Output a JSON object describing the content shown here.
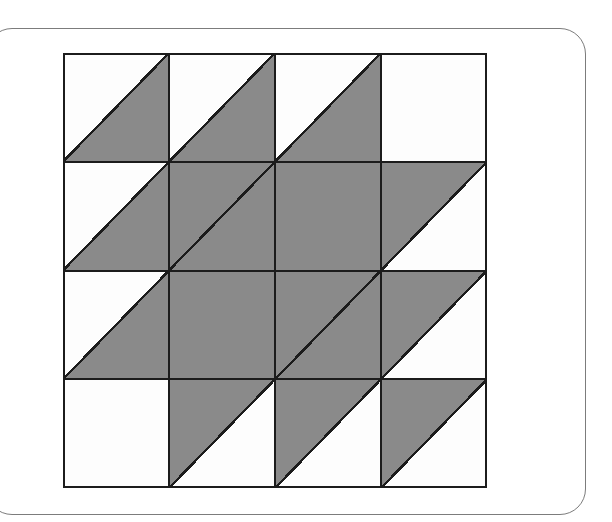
{
  "page": {
    "background_color": "#ffffff",
    "frame": {
      "name": "rounded-page-frame",
      "border_color": "#7c7c7c",
      "border_radius_px": 26
    }
  },
  "figure": {
    "name": "quilt-block-pattern",
    "grid_rows": 4,
    "grid_cols": 4,
    "x_px": 63,
    "y_px": 53,
    "width_px": 424,
    "height_px": 435,
    "cell_width_px": 106,
    "cell_height_px": 108.75,
    "fill_color": "#8a8a8a",
    "empty_color": "#fdfdfd",
    "line_color": "#1c1c1c",
    "outer_line_width_px": 2,
    "inner_line_width_px": 2,
    "diagonal_line_width_px": 2.4,
    "diagonal_direction": "bottom-left-to-top-right"
  },
  "chart_data": {
    "type": "heatmap",
    "title": "",
    "xlabel": "",
    "ylabel": "",
    "categories_x": [
      "1",
      "2",
      "3",
      "4"
    ],
    "categories_y": [
      "1",
      "2",
      "3",
      "4"
    ],
    "legend": [
      {
        "label": "shaded half",
        "color": "#8a8a8a"
      },
      {
        "label": "unshaded half",
        "color": "#fdfdfd"
      }
    ],
    "cell_states": [
      [
        "lower-right",
        "lower-right",
        "lower-right",
        "empty"
      ],
      [
        "lower-right",
        "full-diagonal",
        "full",
        "upper-left"
      ],
      [
        "lower-right",
        "full",
        "full-diagonal",
        "upper-left"
      ],
      [
        "empty",
        "upper-left",
        "upper-left",
        "upper-left"
      ]
    ],
    "shaded_fraction_values": [
      [
        0.5,
        0.5,
        0.5,
        0.0
      ],
      [
        0.5,
        1.0,
        1.0,
        0.5
      ],
      [
        0.5,
        1.0,
        1.0,
        0.5
      ],
      [
        0.0,
        0.5,
        0.5,
        0.5
      ]
    ],
    "total_shaded_units": 9.0,
    "total_units": 16
  }
}
